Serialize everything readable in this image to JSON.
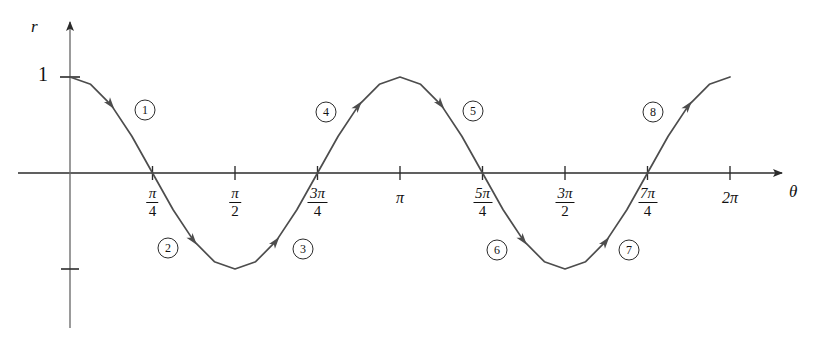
{
  "figure": {
    "curve_color": "#4d4d4d",
    "axis_color": "#2b2b2b",
    "background": "#ffffff"
  },
  "axes": {
    "y_axis_label": "r",
    "x_axis_label": "θ",
    "y_tick_label": "1",
    "y_tick_value": 1,
    "y_negative_tick_label": "",
    "y_negative_tick_value": -1
  },
  "xticks": [
    {
      "id": "pi-over-4",
      "type": "fraction",
      "numerator": "π",
      "denominator": "4",
      "value": 0.785398,
      "display": "π/4"
    },
    {
      "id": "pi-over-2",
      "type": "fraction",
      "numerator": "π",
      "denominator": "2",
      "value": 1.570796,
      "display": "π/2"
    },
    {
      "id": "3pi-over-4",
      "type": "fraction",
      "numerator": "3π",
      "denominator": "4",
      "value": 2.356194,
      "display": "3π/4"
    },
    {
      "id": "pi",
      "type": "plain",
      "text": "π",
      "value": 3.141593,
      "display": "π"
    },
    {
      "id": "5pi-over-4",
      "type": "fraction",
      "numerator": "5π",
      "denominator": "4",
      "value": 3.926991,
      "display": "5π/4"
    },
    {
      "id": "3pi-over-2",
      "type": "fraction",
      "numerator": "3π",
      "denominator": "2",
      "value": 4.712389,
      "display": "3π/2"
    },
    {
      "id": "7pi-over-4",
      "type": "fraction",
      "numerator": "7π",
      "denominator": "4",
      "value": 5.497787,
      "display": "7π/4"
    },
    {
      "id": "2pi",
      "type": "plain",
      "text": "2π",
      "value": 6.283185,
      "display": "2π"
    }
  ],
  "segments": [
    {
      "label": "①",
      "number": 1,
      "x": 145,
      "y": 110,
      "theta_from": 0.0,
      "theta_to": 0.785398,
      "direction": "down"
    },
    {
      "label": "②",
      "number": 2,
      "x": 168,
      "y": 248,
      "theta_from": 0.785398,
      "theta_to": 1.570796,
      "direction": "down"
    },
    {
      "label": "③",
      "number": 3,
      "x": 303,
      "y": 249,
      "theta_from": 1.570796,
      "theta_to": 2.356194,
      "direction": "up"
    },
    {
      "label": "④",
      "number": 4,
      "x": 326,
      "y": 112,
      "theta_from": 2.356194,
      "theta_to": 3.141593,
      "direction": "up"
    },
    {
      "label": "⑤",
      "number": 5,
      "x": 473,
      "y": 111,
      "theta_from": 3.141593,
      "theta_to": 3.926991,
      "direction": "down"
    },
    {
      "label": "⑥",
      "number": 6,
      "x": 497,
      "y": 250,
      "theta_from": 3.926991,
      "theta_to": 4.712389,
      "direction": "down"
    },
    {
      "label": "⑦",
      "number": 7,
      "x": 629,
      "y": 250,
      "theta_from": 4.712389,
      "theta_to": 5.497787,
      "direction": "up"
    },
    {
      "label": "⑧",
      "number": 8,
      "x": 653,
      "y": 112,
      "theta_from": 5.497787,
      "theta_to": 6.283185,
      "direction": "up"
    }
  ],
  "chart_data": {
    "type": "line",
    "title": "",
    "xlabel": "θ",
    "ylabel": "r",
    "function": "r = cos(2θ)",
    "xlim": [
      0,
      6.283185
    ],
    "ylim": [
      -1,
      1
    ],
    "grid": false,
    "legend": "none",
    "series": [
      {
        "name": "r = cos 2θ",
        "color": "#4d4d4d",
        "x": [
          0.0,
          0.19635,
          0.392699,
          0.589049,
          0.785398,
          0.981748,
          1.178097,
          1.374447,
          1.570796,
          1.767146,
          1.963495,
          2.159845,
          2.356194,
          2.552544,
          2.748894,
          2.945243,
          3.141593,
          3.337942,
          3.534292,
          3.730641,
          3.926991,
          4.12334,
          4.31969,
          4.516039,
          4.712389,
          4.908739,
          5.105088,
          5.301438,
          5.497787,
          5.694137,
          5.890486,
          6.086836,
          6.283185
        ],
        "y": [
          1.0,
          0.924,
          0.707,
          0.383,
          0.0,
          -0.383,
          -0.707,
          -0.924,
          -1.0,
          -0.924,
          -0.707,
          -0.383,
          0.0,
          0.383,
          0.707,
          0.924,
          1.0,
          0.924,
          0.707,
          0.383,
          0.0,
          -0.383,
          -0.707,
          -0.924,
          -1.0,
          -0.924,
          -0.707,
          -0.383,
          0.0,
          0.383,
          0.707,
          0.924,
          1.0
        ]
      }
    ],
    "annotations": [
      {
        "text": "①",
        "theta_range": [
          0.0,
          0.785398
        ]
      },
      {
        "text": "②",
        "theta_range": [
          0.785398,
          1.570796
        ]
      },
      {
        "text": "③",
        "theta_range": [
          1.570796,
          2.356194
        ]
      },
      {
        "text": "④",
        "theta_range": [
          2.356194,
          3.141593
        ]
      },
      {
        "text": "⑤",
        "theta_range": [
          3.141593,
          3.926991
        ]
      },
      {
        "text": "⑥",
        "theta_range": [
          3.926991,
          4.712389
        ]
      },
      {
        "text": "⑦",
        "theta_range": [
          4.712389,
          5.497787
        ]
      },
      {
        "text": "⑧",
        "theta_range": [
          5.497787,
          6.283185
        ]
      }
    ],
    "xtick_values": [
      0.785398,
      1.570796,
      2.356194,
      3.141593,
      3.926991,
      4.712389,
      5.497787,
      6.283185
    ],
    "xtick_labels": [
      "π/4",
      "π/2",
      "3π/4",
      "π",
      "5π/4",
      "3π/2",
      "7π/4",
      "2π"
    ],
    "ytick_values": [
      1
    ],
    "ytick_labels": [
      "1"
    ]
  }
}
